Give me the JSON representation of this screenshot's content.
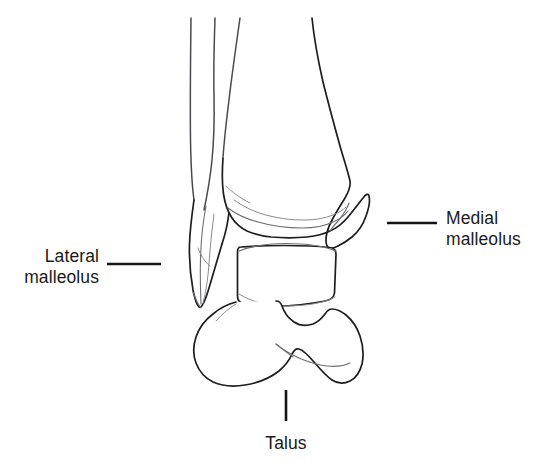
{
  "figure": {
    "title": "Ankle joint anatomy — anterior view line drawing",
    "background_color": "#ffffff",
    "outline_color": "#1d1d1d",
    "detail_color": "#6e6e72",
    "label_color": "#1a1a1a",
    "width": 536,
    "height": 471
  },
  "labels": {
    "lateral_malleolus": {
      "line1": "Lateral",
      "line2": "malleolus",
      "align": "right"
    },
    "medial_malleolus": {
      "line1": "Medial",
      "line2": "malleolus",
      "align": "left"
    },
    "talus": {
      "line1": "Talus",
      "align": "center"
    }
  },
  "structures": [
    {
      "name": "tibia",
      "label": "Tibia shaft and distal end"
    },
    {
      "name": "fibula",
      "label": "Fibula shaft and lateral malleolus"
    },
    {
      "name": "talus-dome",
      "label": "Talar dome"
    },
    {
      "name": "talus-body",
      "label": "Talar body"
    }
  ]
}
